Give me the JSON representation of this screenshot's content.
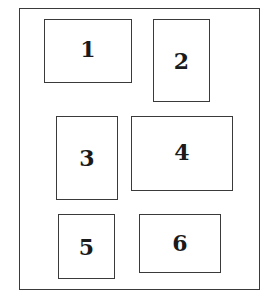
{
  "diagram": {
    "type": "panel-layout",
    "outer": {
      "x": 19,
      "y": 8,
      "w": 241,
      "h": 282
    },
    "panels": [
      {
        "label": "1",
        "x": 44,
        "y": 19,
        "w": 88,
        "h": 64
      },
      {
        "label": "2",
        "x": 153,
        "y": 19,
        "w": 57,
        "h": 83
      },
      {
        "label": "3",
        "x": 56,
        "y": 116,
        "w": 62,
        "h": 84
      },
      {
        "label": "4",
        "x": 131,
        "y": 116,
        "w": 102,
        "h": 75
      },
      {
        "label": "5",
        "x": 58,
        "y": 214,
        "w": 57,
        "h": 65
      },
      {
        "label": "6",
        "x": 139,
        "y": 214,
        "w": 82,
        "h": 59
      }
    ],
    "colors": {
      "stroke": "#3a3a3a",
      "text": "#1a1a1a",
      "background": "#ffffff"
    }
  }
}
